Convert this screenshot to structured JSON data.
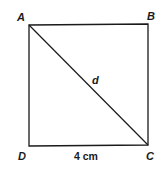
{
  "diagram": {
    "shape": "square",
    "vertices": {
      "A": {
        "label": "A",
        "x": 29,
        "y": 25
      },
      "B": {
        "label": "B",
        "x": 148,
        "y": 24
      },
      "C": {
        "label": "C",
        "x": 148,
        "y": 145
      },
      "D": {
        "label": "D",
        "x": 29,
        "y": 146
      }
    },
    "diagonal": {
      "from": "A",
      "to": "C",
      "label": "d"
    },
    "side_label": {
      "side": "DC",
      "text": "4 cm"
    },
    "stroke_color": "#1a1a1a",
    "background": "#ffffff"
  }
}
